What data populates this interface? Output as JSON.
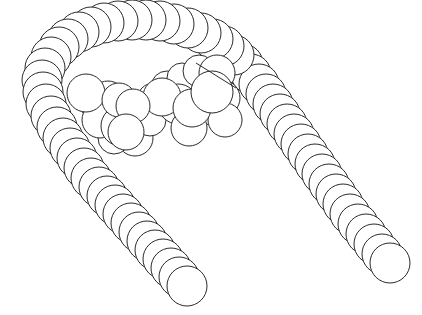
{
  "figure": {
    "stroke_color": "#2a2a2a",
    "fill_color": "#ffffff",
    "background": "#ffffff"
  },
  "chain": {
    "bead_radius": 20,
    "left_arm": [
      [
        187,
        286
      ],
      [
        179,
        277
      ],
      [
        171,
        268
      ],
      [
        163,
        259
      ],
      [
        155,
        250
      ],
      [
        147,
        241
      ],
      [
        139,
        232
      ],
      [
        131,
        223
      ],
      [
        123,
        214
      ],
      [
        115,
        205
      ],
      [
        107,
        196
      ],
      [
        99,
        187
      ],
      [
        91,
        178
      ],
      [
        84,
        168
      ],
      [
        77,
        158
      ],
      [
        70,
        148
      ],
      [
        63,
        138
      ],
      [
        57,
        127
      ],
      [
        51,
        116
      ]
    ],
    "bend": [
      [
        46,
        104
      ],
      [
        43,
        92
      ],
      [
        42,
        80
      ],
      [
        45,
        68
      ],
      [
        51,
        57
      ],
      [
        59,
        47
      ],
      [
        68,
        39
      ],
      [
        79,
        32
      ],
      [
        91,
        27
      ],
      [
        104,
        23
      ],
      [
        118,
        21
      ],
      [
        132,
        20
      ],
      [
        146,
        20
      ],
      [
        160,
        21
      ],
      [
        174,
        24
      ],
      [
        188,
        28
      ],
      [
        201,
        33
      ],
      [
        213,
        39
      ],
      [
        224,
        46
      ],
      [
        234,
        55
      ]
    ],
    "right_arm": [
      [
        243,
        64
      ],
      [
        251,
        74
      ],
      [
        259,
        84
      ],
      [
        266,
        94
      ],
      [
        273,
        104
      ],
      [
        280,
        114
      ],
      [
        287,
        124
      ],
      [
        294,
        134
      ],
      [
        301,
        144
      ],
      [
        308,
        154
      ],
      [
        315,
        164
      ],
      [
        322,
        174
      ],
      [
        329,
        184
      ],
      [
        336,
        194
      ],
      [
        343,
        204
      ],
      [
        350,
        214
      ],
      [
        358,
        224
      ],
      [
        366,
        234
      ],
      [
        374,
        244
      ],
      [
        382,
        254
      ],
      [
        390,
        263
      ]
    ]
  },
  "cluster": {
    "circles": [
      [
        96,
        104,
        16
      ],
      [
        108,
        99,
        18
      ],
      [
        123,
        104,
        15
      ],
      [
        154,
        100,
        17
      ],
      [
        167,
        87,
        16
      ],
      [
        182,
        78,
        15
      ],
      [
        199,
        71,
        16
      ],
      [
        217,
        73,
        18
      ],
      [
        119,
        120,
        18
      ],
      [
        135,
        138,
        18
      ],
      [
        114,
        138,
        16
      ],
      [
        150,
        120,
        16
      ],
      [
        178,
        104,
        20
      ],
      [
        200,
        108,
        18
      ],
      [
        222,
        98,
        18
      ],
      [
        225,
        120,
        17
      ],
      [
        189,
        128,
        18
      ],
      [
        100,
        120,
        18
      ],
      [
        121,
        126,
        20
      ],
      [
        86,
        93,
        19
      ],
      [
        119,
        100,
        17
      ],
      [
        162,
        97,
        19
      ],
      [
        192,
        108,
        19
      ],
      [
        212,
        92,
        21
      ],
      [
        133,
        106,
        17
      ],
      [
        126,
        132,
        18
      ]
    ],
    "divider_line": [
      196,
      63,
      236,
      88
    ]
  }
}
